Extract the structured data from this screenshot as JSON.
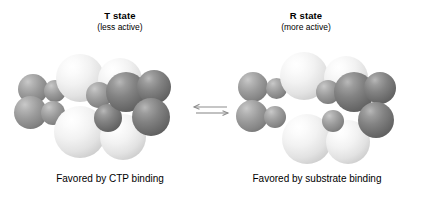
{
  "figure": {
    "background_color": "#ffffff",
    "left_panel": {
      "title": "T state",
      "subtitle": "(less active)",
      "caption": "Favored by CTP binding"
    },
    "right_panel": {
      "title": "R state",
      "subtitle": "(more active)",
      "caption": "Favored by substrate binding"
    },
    "equilibrium_arrow": {
      "name": "equilibrium-arrow",
      "description": "double half-arrow equilibrium symbol",
      "color": "#8a8a8a"
    },
    "colors": {
      "light_subunit": "#f2f2f2",
      "mid_subunit": "#9b9b9b",
      "dark_subunit": "#838383",
      "text": "#000000"
    },
    "models": {
      "t_state": {
        "name": "t-state-space-filling-model",
        "spheres": [
          {
            "cls": "mid",
            "x": 10,
            "y": 26,
            "d": 30,
            "z": 2
          },
          {
            "cls": "mid",
            "x": 6,
            "y": 48,
            "d": 33,
            "z": 3
          },
          {
            "cls": "mid",
            "x": 36,
            "y": 32,
            "d": 22,
            "z": 4
          },
          {
            "cls": "mid",
            "x": 33,
            "y": 53,
            "d": 24,
            "z": 5
          },
          {
            "cls": "light",
            "x": 48,
            "y": 6,
            "d": 48,
            "z": 6
          },
          {
            "cls": "light",
            "x": 90,
            "y": 10,
            "d": 44,
            "z": 6
          },
          {
            "cls": "light",
            "x": 46,
            "y": 58,
            "d": 52,
            "z": 7
          },
          {
            "cls": "light",
            "x": 92,
            "y": 66,
            "d": 46,
            "z": 7
          },
          {
            "cls": "mid",
            "x": 78,
            "y": 34,
            "d": 26,
            "z": 9
          },
          {
            "cls": "dark",
            "x": 98,
            "y": 24,
            "d": 40,
            "z": 10
          },
          {
            "cls": "dark",
            "x": 129,
            "y": 22,
            "d": 34,
            "z": 10
          },
          {
            "cls": "dark",
            "x": 124,
            "y": 50,
            "d": 38,
            "z": 11
          },
          {
            "cls": "dark",
            "x": 86,
            "y": 56,
            "d": 28,
            "z": 9
          }
        ]
      },
      "r_state": {
        "name": "r-state-space-filling-model",
        "spheres": [
          {
            "cls": "mid",
            "x": 8,
            "y": 24,
            "d": 30,
            "z": 2
          },
          {
            "cls": "mid",
            "x": 6,
            "y": 52,
            "d": 32,
            "z": 3
          },
          {
            "cls": "mid",
            "x": 36,
            "y": 30,
            "d": 21,
            "z": 4
          },
          {
            "cls": "mid",
            "x": 34,
            "y": 58,
            "d": 22,
            "z": 5
          },
          {
            "cls": "light",
            "x": 50,
            "y": 4,
            "d": 48,
            "z": 6
          },
          {
            "cls": "light",
            "x": 94,
            "y": 8,
            "d": 44,
            "z": 6
          },
          {
            "cls": "light",
            "x": 52,
            "y": 66,
            "d": 50,
            "z": 7
          },
          {
            "cls": "light",
            "x": 96,
            "y": 72,
            "d": 44,
            "z": 7
          },
          {
            "cls": "mid",
            "x": 86,
            "y": 32,
            "d": 24,
            "z": 9
          },
          {
            "cls": "dark",
            "x": 104,
            "y": 24,
            "d": 40,
            "z": 10
          },
          {
            "cls": "dark",
            "x": 134,
            "y": 24,
            "d": 32,
            "z": 10
          },
          {
            "cls": "dark",
            "x": 128,
            "y": 54,
            "d": 36,
            "z": 11
          },
          {
            "cls": "mid",
            "x": 92,
            "y": 62,
            "d": 22,
            "z": 9
          }
        ]
      }
    }
  }
}
